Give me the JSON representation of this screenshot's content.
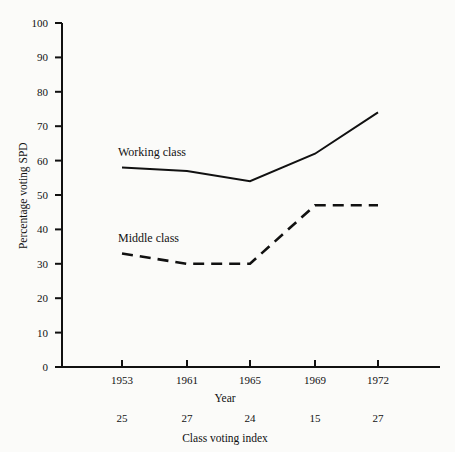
{
  "chart_data": {
    "type": "line",
    "title": "",
    "xlabel": "Year",
    "ylabel": "Percentage voting SPD",
    "secondary_xlabel": "Class voting index",
    "categories": [
      "1953",
      "1961",
      "1965",
      "1969",
      "1972"
    ],
    "ylim": [
      0,
      100
    ],
    "yticks": [
      "0",
      "10",
      "20",
      "30",
      "40",
      "50",
      "60",
      "70",
      "80",
      "90",
      "100"
    ],
    "grid": false,
    "legend_position": "inline-labels",
    "secondary_axis_values": [
      "25",
      "27",
      "24",
      "15",
      "27"
    ],
    "series": [
      {
        "name": "Working class",
        "style": "solid",
        "values": [
          58,
          57,
          54,
          62,
          74
        ]
      },
      {
        "name": "Middle class",
        "style": "dashed",
        "values": [
          33,
          30,
          30,
          47,
          47
        ]
      }
    ]
  },
  "colors": {
    "ink": "#111111",
    "background": "#fbfbf9"
  }
}
